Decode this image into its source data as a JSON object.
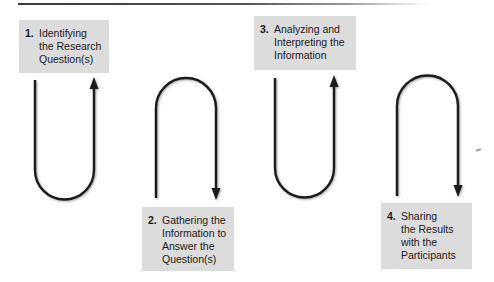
{
  "diagram": {
    "type": "process-flow",
    "steps": [
      {
        "number": "1.",
        "lines": [
          "Identifying",
          "the Research",
          "Question(s)"
        ],
        "box": {
          "x": 19,
          "y": 20,
          "w": 90,
          "h": 53
        },
        "position": "top"
      },
      {
        "number": "2.",
        "lines": [
          "Gathering the",
          "Information to",
          "Answer the",
          "Question(s)"
        ],
        "box": {
          "x": 142,
          "y": 207,
          "w": 92,
          "h": 64
        },
        "position": "bottom"
      },
      {
        "number": "3.",
        "lines": [
          "Analyzing and",
          "Interpreting the",
          "Information"
        ],
        "box": {
          "x": 254,
          "y": 16,
          "w": 102,
          "h": 54
        },
        "position": "top"
      },
      {
        "number": "4.",
        "lines": [
          "Sharing",
          "the Results",
          "with the",
          "Participants"
        ],
        "box": {
          "x": 381,
          "y": 203,
          "w": 91,
          "h": 66
        },
        "position": "bottom"
      }
    ],
    "connectors": [
      {
        "shape": "U",
        "direction": "up",
        "from_step": 1,
        "to_step": 2
      },
      {
        "shape": "arch",
        "direction": "down",
        "from_step": 1,
        "to_step": 2
      },
      {
        "shape": "U",
        "direction": "up",
        "from_step": 2,
        "to_step": 3
      },
      {
        "shape": "arch",
        "direction": "down",
        "from_step": 3,
        "to_step": 4
      }
    ],
    "colors": {
      "box_fill": "#dcdcdc",
      "stroke": "#1a1a1a",
      "text": "#1a1a1a"
    }
  }
}
